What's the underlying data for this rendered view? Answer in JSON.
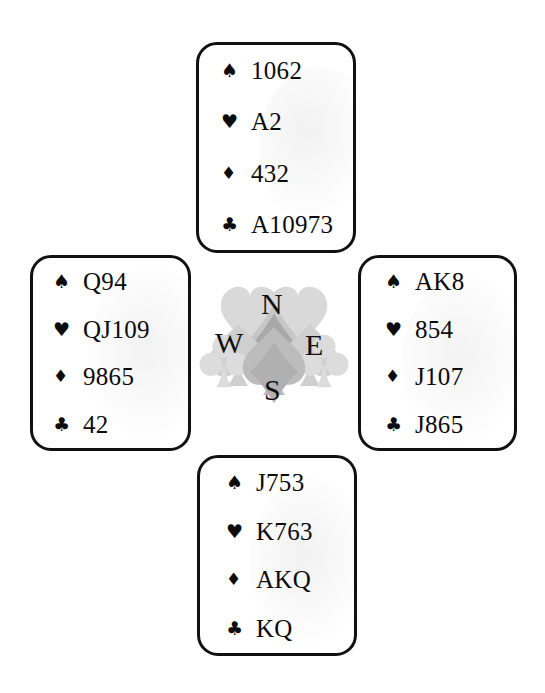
{
  "diagram": {
    "type": "bridge-deal-four-hands"
  },
  "suits": {
    "spade": {
      "name": "spade-suit-symbol",
      "glyph": "♠",
      "color": "#0b0b0b"
    },
    "heart": {
      "name": "heart-suit-symbol",
      "glyph": "♥",
      "color": "#0b0b0b"
    },
    "diamond": {
      "name": "diamond-suit-symbol",
      "glyph": "♦",
      "color": "#0b0b0b"
    },
    "club": {
      "name": "club-suit-symbol",
      "glyph": "♣",
      "color": "#0b0b0b"
    }
  },
  "hands": {
    "north": {
      "position": "North",
      "spades": "1062",
      "hearts": "A2",
      "diamonds": "432",
      "clubs": "A10973"
    },
    "west": {
      "position": "West",
      "spades": "Q94",
      "hearts": "QJ109",
      "diamonds": "9865",
      "clubs": "42"
    },
    "east": {
      "position": "East",
      "spades": "AK8",
      "hearts": "854",
      "diamonds": "J107",
      "clubs": "J865"
    },
    "south": {
      "position": "South",
      "spades": "J753",
      "hearts": "K763",
      "diamonds": "AKQ",
      "clubs": "KQ"
    }
  },
  "compass": {
    "north_label": "N",
    "west_label": "W",
    "east_label": "E",
    "south_label": "S",
    "watermark": "overlapping card suit symbols",
    "watermark_color": "#b9b9b9"
  },
  "colors": {
    "background": "#ffffff",
    "ink": "#0b0b0b",
    "border": "#111111",
    "watermark_light": "#d6d6d6",
    "watermark_mid": "#bdbdbd",
    "watermark_dark": "#9a9a9a"
  }
}
